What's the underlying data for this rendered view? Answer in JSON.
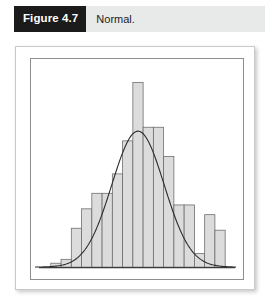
{
  "figure": {
    "number_label": "Figure 4.7",
    "caption": "Normal."
  },
  "colors": {
    "label_box_background": "#1b1b1b",
    "label_box_text": "#ffffff",
    "caption_band_background": "#e8e9e9",
    "caption_text": "#1d1d1d",
    "bar_fill": "#dcdcdc",
    "bar_stroke": "#6e6e6e",
    "curve_stroke": "#2b2b2b",
    "plot_frame_stroke": "#8d8d8d",
    "card_border": "#c9c9c9",
    "page_background": "#ffffff"
  },
  "chart_data": {
    "type": "bar",
    "title": "Normal.",
    "xlabel": "",
    "ylabel": "",
    "grid": false,
    "legend": false,
    "axis_ticks_visible": false,
    "tick_labels_visible": false,
    "xlim": [
      0,
      17
    ],
    "ylim": [
      0,
      100
    ],
    "categories": [
      "1",
      "2",
      "3",
      "4",
      "5",
      "6",
      "7",
      "8",
      "9",
      "10",
      "11",
      "12",
      "13",
      "14",
      "15",
      "16",
      "17"
    ],
    "values": [
      2,
      4,
      20,
      30,
      38,
      38,
      48,
      65,
      95,
      72,
      72,
      57,
      32,
      32,
      7,
      27,
      19
    ],
    "overlay": {
      "type": "line",
      "name": "normal-curve",
      "description": "Fitted normal density curve overlaid on histogram",
      "peak_category": "9",
      "peak_value": 70
    },
    "annotations": []
  }
}
